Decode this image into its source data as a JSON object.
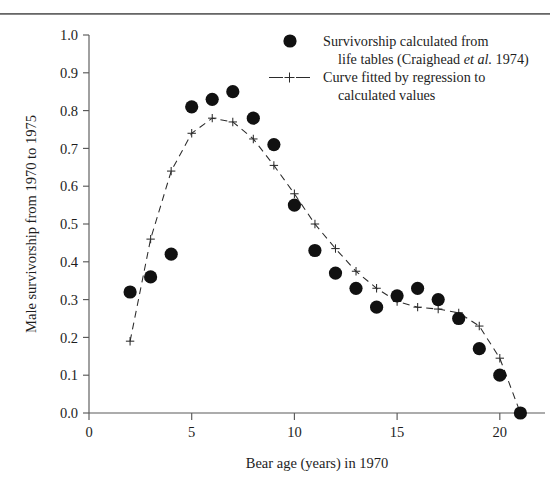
{
  "figure": {
    "background": "#ffffff",
    "rule_color": "#777777",
    "marker_color": "#111111",
    "curve_color": "#2b2b2b",
    "axis_color": "#5a5a5a"
  },
  "chart_data": {
    "type": "scatter",
    "title": "",
    "xlabel": "Bear age (years) in 1970",
    "ylabel": "Male survivorship from 1970 to 1975",
    "xlim": [
      0,
      22.2
    ],
    "ylim": [
      0.0,
      1.0
    ],
    "grid": false,
    "xticks": [
      0,
      5,
      10,
      15,
      20
    ],
    "xtick_labels": [
      "0",
      "5",
      "10",
      "15",
      "20"
    ],
    "yticks": [
      0.0,
      0.1,
      0.2,
      0.3,
      0.4,
      0.5,
      0.6,
      0.7,
      0.8,
      0.9,
      1.0
    ],
    "ytick_labels": [
      "0.0",
      "0.1",
      "0.2",
      "0.3",
      "0.4",
      "0.5",
      "0.6",
      "0.7",
      "0.8",
      "0.9",
      "1.0"
    ],
    "legend_position": "top-right",
    "series": [
      {
        "name": "Survivorship calculated from life tables (Craighead et al. 1974)",
        "marker": "filled-circle",
        "x": [
          2,
          3,
          4,
          5,
          6,
          7,
          8,
          9,
          10,
          11,
          12,
          13,
          14,
          15,
          16,
          17,
          18,
          19,
          20,
          21
        ],
        "values": [
          0.32,
          0.36,
          0.42,
          0.81,
          0.83,
          0.85,
          0.78,
          0.71,
          0.55,
          0.43,
          0.37,
          0.33,
          0.28,
          0.31,
          0.33,
          0.3,
          0.25,
          0.17,
          0.1,
          0.0
        ]
      },
      {
        "name": "Curve fitted by regression to calculated values",
        "marker": "plus-dashed-line",
        "x": [
          2,
          3,
          4,
          5,
          6,
          7,
          8,
          9,
          10,
          11,
          12,
          13,
          14,
          15,
          16,
          17,
          18,
          19,
          20,
          21
        ],
        "values": [
          0.19,
          0.46,
          0.64,
          0.74,
          0.78,
          0.77,
          0.725,
          0.655,
          0.58,
          0.5,
          0.435,
          0.375,
          0.33,
          0.295,
          0.28,
          0.275,
          0.265,
          0.23,
          0.145,
          0.0
        ]
      }
    ]
  },
  "legend": {
    "entries": [
      {
        "marker": "filled-circle",
        "line1": "Survivorship calculated from",
        "line2_pre": "life tables (Craighead ",
        "line2_italic": "et al.",
        "line2_post": " 1974)"
      },
      {
        "marker": "plus-dashed-line",
        "line1": "Curve fitted by regression to",
        "line2_pre": "calculated values",
        "line2_italic": "",
        "line2_post": ""
      }
    ]
  }
}
